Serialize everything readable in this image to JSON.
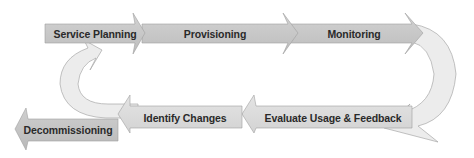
{
  "diagram": {
    "type": "lifecycle-flow",
    "colors": {
      "arrow_dark": "#c8c8c8",
      "arrow_light": "#e2e2e2",
      "loop": "#ededed",
      "outline": "#9a9a9a",
      "text": "#2a2a2a"
    },
    "top_row": [
      {
        "label": "Service Planning"
      },
      {
        "label": "Provisioning"
      },
      {
        "label": "Monitoring"
      }
    ],
    "bottom_row": [
      {
        "label": "Evaluate Usage & Feedback"
      },
      {
        "label": "Identify Changes"
      },
      {
        "label": "Decommissioning"
      }
    ],
    "loops": [
      {
        "name": "right-return-loop",
        "from": "Monitoring",
        "to": "Evaluate Usage & Feedback"
      },
      {
        "name": "left-return-loop",
        "from": "Identify Changes",
        "to": "Service Planning"
      }
    ]
  }
}
